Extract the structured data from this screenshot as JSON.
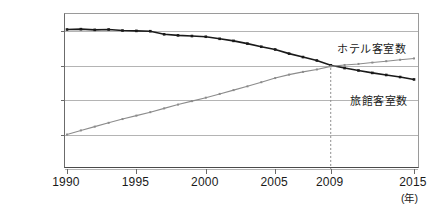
{
  "chart_data": {
    "type": "line",
    "title": "",
    "xlabel": "(年)",
    "ylabel": "",
    "xlim": [
      1990,
      2015
    ],
    "ylim": [
      20000,
      110000
    ],
    "grid": true,
    "legend_position": "inline-right",
    "x": [
      1990,
      1991,
      1992,
      1993,
      1994,
      1995,
      1996,
      1997,
      1998,
      1999,
      2000,
      2001,
      2002,
      2003,
      2004,
      2005,
      2006,
      2007,
      2008,
      2009,
      2010,
      2011,
      2012,
      2013,
      2014,
      2015
    ],
    "xtick_labels": [
      "1990",
      "1995",
      "2000",
      "2005",
      "2009",
      "2015"
    ],
    "xtick_values": [
      1990,
      1995,
      2000,
      2005,
      2009,
      2015
    ],
    "ytick_labels": [
      "1,000,000",
      "80,000",
      "60,000",
      "40,000"
    ],
    "ytick_values": [
      100000,
      80000,
      60000,
      40000
    ],
    "annotation_year": 2009,
    "series": [
      {
        "name": "旅館客室数",
        "color": "#1a1a1a",
        "marker": "square",
        "values": [
          101000,
          101200,
          100800,
          101000,
          100400,
          100200,
          100000,
          98200,
          97600,
          97200,
          96800,
          95600,
          94400,
          92800,
          91000,
          89400,
          87000,
          85000,
          83000,
          80200,
          78600,
          77200,
          75800,
          74600,
          73400,
          72000
        ]
      },
      {
        "name": "ホテル客室数",
        "color": "#8c8c8c",
        "marker": "square",
        "values": [
          40000,
          42400,
          44600,
          46800,
          49000,
          51000,
          53000,
          55200,
          57400,
          59400,
          61400,
          63600,
          65800,
          68000,
          70400,
          72800,
          74800,
          76400,
          77800,
          79600,
          80400,
          81000,
          81800,
          82600,
          83400,
          84200
        ]
      }
    ]
  },
  "axis": {
    "unit_label": "(年)"
  },
  "labels": {
    "hotel": "ホテル客室数",
    "ryokan": "旅館客室数"
  }
}
